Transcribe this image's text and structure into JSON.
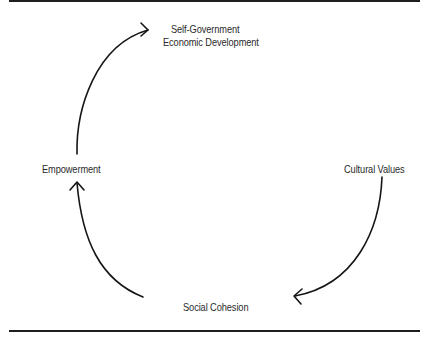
{
  "diagram": {
    "type": "cycle",
    "nodes": [
      {
        "id": "self-gov",
        "lines": [
          "Self-Government",
          "Economic Development"
        ]
      },
      {
        "id": "cultural-values",
        "label": "Cultural Values"
      },
      {
        "id": "social-cohesion",
        "label": "Social Cohesion"
      },
      {
        "id": "empowerment",
        "label": "Empowerment"
      }
    ],
    "edges": [
      {
        "from": "cultural-values",
        "to": "social-cohesion"
      },
      {
        "from": "social-cohesion",
        "to": "empowerment"
      },
      {
        "from": "empowerment",
        "to": "self-gov"
      }
    ],
    "colors": {
      "line": "#151515",
      "text": "#2a2a2a",
      "background": "#ffffff"
    }
  }
}
